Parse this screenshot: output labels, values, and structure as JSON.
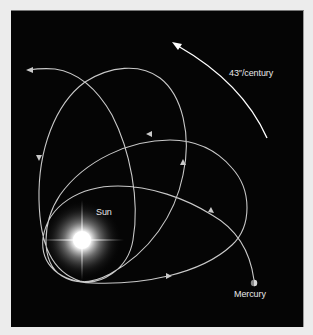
{
  "labels": {
    "sun": "Sun",
    "mercury": "Mercury",
    "precession_rate": "43″/century"
  },
  "colors": {
    "background": "#050505",
    "orbit": "#c9c9c9",
    "precession_arrow": "#ffffff",
    "page": "#ececec"
  },
  "icons": {
    "sun": "glowing-star",
    "mercury": "small-planet-disc",
    "precession_arrow": "curved-arrow-counterclockwise"
  }
}
